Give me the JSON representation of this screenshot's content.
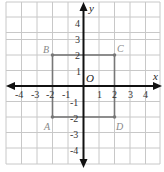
{
  "diagram": {
    "type": "coordinate-plane",
    "axes": {
      "x_label": "x",
      "y_label": "y",
      "origin_label": "O"
    },
    "x_ticks": [
      "-4",
      "-3",
      "-2",
      "-1",
      "1",
      "2",
      "3",
      "4"
    ],
    "y_ticks": [
      "4",
      "3",
      "2",
      "1",
      "-1",
      "-2",
      "-3",
      "-4"
    ],
    "points": [
      {
        "name": "A",
        "x": -2,
        "y": -2
      },
      {
        "name": "B",
        "x": -2,
        "y": 2
      },
      {
        "name": "C",
        "x": 2,
        "y": 2
      },
      {
        "name": "D",
        "x": 2,
        "y": -2
      }
    ],
    "shape": "square ABCD",
    "colors": {
      "grid": "#c8c8c8",
      "axis": "#111111",
      "square": "#777777"
    }
  }
}
